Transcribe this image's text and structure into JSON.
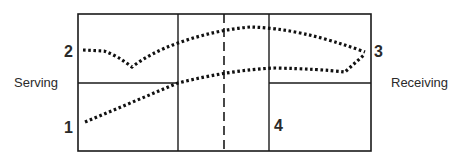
{
  "diagram": {
    "labels": {
      "left_side": "Serving",
      "right_side": "Receiving"
    },
    "positions": [
      {
        "id": "1",
        "label": "1"
      },
      {
        "id": "2",
        "label": "2"
      },
      {
        "id": "3",
        "label": "3"
      },
      {
        "id": "4",
        "label": "4"
      }
    ],
    "colors": {
      "line": "#1a1a1a",
      "text": "#2a2a2a",
      "background": "#ffffff"
    },
    "paths": [
      {
        "name": "path-from-1",
        "style": "dotted",
        "from": "1",
        "to": "3"
      },
      {
        "name": "path-from-2",
        "style": "dotted",
        "from": "2",
        "to": "3"
      }
    ],
    "center_line": {
      "style": "dashed"
    }
  }
}
